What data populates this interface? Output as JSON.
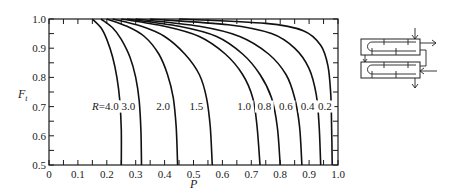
{
  "chart_data": {
    "type": "line",
    "title": "",
    "xlabel": "P",
    "ylabel": "F_t",
    "xlim": [
      0,
      1.0
    ],
    "ylim": [
      0.5,
      1.0
    ],
    "grid": false,
    "legend": "none (curves labeled inline with R values)",
    "x_ticks": [
      "0",
      "0.1",
      "0.2",
      "0.3",
      "0.4",
      "0.5",
      "0.6",
      "0.7",
      "0.8",
      "0.9",
      "1.0"
    ],
    "y_ticks": [
      "0.5",
      "0.6",
      "0.7",
      "0.8",
      "0.9",
      "1.0"
    ],
    "series": [
      {
        "name": "R=4.0",
        "label": "R=4.0",
        "x": [
          0.15,
          0.18,
          0.2,
          0.22,
          0.235,
          0.245,
          0.25,
          0.25
        ],
        "y": [
          1.0,
          0.97,
          0.93,
          0.87,
          0.8,
          0.72,
          0.62,
          0.5
        ]
      },
      {
        "name": "R=3.0",
        "label": "3.0",
        "x": [
          0.18,
          0.22,
          0.25,
          0.28,
          0.3,
          0.312,
          0.318,
          0.32
        ],
        "y": [
          1.0,
          0.97,
          0.93,
          0.87,
          0.8,
          0.72,
          0.62,
          0.5
        ]
      },
      {
        "name": "R=2.0",
        "label": "2.0",
        "x": [
          0.2,
          0.27,
          0.33,
          0.38,
          0.41,
          0.43,
          0.44,
          0.445
        ],
        "y": [
          1.0,
          0.975,
          0.94,
          0.88,
          0.81,
          0.73,
          0.63,
          0.5
        ]
      },
      {
        "name": "R=1.5",
        "label": "1.5",
        "x": [
          0.22,
          0.32,
          0.4,
          0.47,
          0.52,
          0.545,
          0.558,
          0.565
        ],
        "y": [
          1.0,
          0.975,
          0.94,
          0.88,
          0.81,
          0.73,
          0.63,
          0.5
        ]
      },
      {
        "name": "R=1.0",
        "label": "1.0",
        "x": [
          0.25,
          0.4,
          0.52,
          0.61,
          0.67,
          0.705,
          0.72,
          0.73
        ],
        "y": [
          1.0,
          0.975,
          0.94,
          0.88,
          0.81,
          0.73,
          0.63,
          0.5
        ]
      },
      {
        "name": "R=0.8",
        "label": "0.8",
        "x": [
          0.27,
          0.45,
          0.58,
          0.67,
          0.73,
          0.77,
          0.79,
          0.8
        ],
        "y": [
          1.0,
          0.975,
          0.94,
          0.88,
          0.81,
          0.73,
          0.63,
          0.5
        ]
      },
      {
        "name": "R=0.6",
        "label": "0.6",
        "x": [
          0.3,
          0.52,
          0.66,
          0.76,
          0.82,
          0.85,
          0.867,
          0.875
        ],
        "y": [
          1.0,
          0.975,
          0.94,
          0.88,
          0.81,
          0.73,
          0.63,
          0.5
        ]
      },
      {
        "name": "R=0.4",
        "label": "0.4",
        "x": [
          0.35,
          0.62,
          0.77,
          0.85,
          0.9,
          0.925,
          0.935,
          0.94
        ],
        "y": [
          1.0,
          0.98,
          0.95,
          0.9,
          0.83,
          0.74,
          0.63,
          0.5
        ]
      },
      {
        "name": "R=0.2",
        "label": "0.2",
        "x": [
          0.45,
          0.75,
          0.88,
          0.94,
          0.965,
          0.975,
          0.978,
          0.98
        ],
        "y": [
          1.0,
          0.985,
          0.96,
          0.91,
          0.84,
          0.74,
          0.63,
          0.5
        ]
      }
    ],
    "label_positions": [
      {
        "text": "R=4.0",
        "x": 0.195,
        "y": 0.69
      },
      {
        "text": "3.0",
        "x": 0.275,
        "y": 0.69
      },
      {
        "text": "2.0",
        "x": 0.395,
        "y": 0.69
      },
      {
        "text": "1.5",
        "x": 0.51,
        "y": 0.69
      },
      {
        "text": "1.0",
        "x": 0.675,
        "y": 0.69
      },
      {
        "text": "0.8",
        "x": 0.745,
        "y": 0.69
      },
      {
        "text": "0.6",
        "x": 0.82,
        "y": 0.69
      },
      {
        "text": "0.4",
        "x": 0.895,
        "y": 0.69
      },
      {
        "text": "0.2",
        "x": 0.955,
        "y": 0.69
      }
    ],
    "annotations": [
      "Schematic: two-shell-pass heat exchanger with multiple tube passes (inset at right)"
    ]
  },
  "axes": {
    "x_title": "P",
    "y_title": "F",
    "y_title_subscript": "t"
  },
  "inset": {
    "description": "2 shell passes, 4+ tube passes schematic"
  }
}
